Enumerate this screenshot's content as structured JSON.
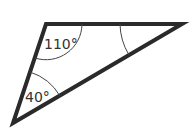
{
  "diagram": {
    "type": "triangle",
    "stroke_color": "#2a2a2a",
    "arc_color": "#444444",
    "vertices": {
      "top_left": [
        46,
        24
      ],
      "right": [
        182,
        24
      ],
      "bottom_left": [
        13,
        123
      ]
    },
    "angles": [
      {
        "vertex": "top_left",
        "label": "110°"
      },
      {
        "vertex": "bottom_left",
        "label": "40°"
      },
      {
        "vertex": "right",
        "label": ""
      }
    ]
  }
}
